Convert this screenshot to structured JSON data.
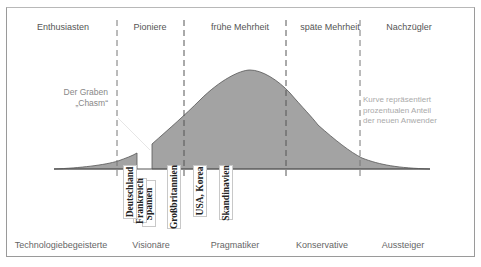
{
  "diagram": {
    "type": "technology-adoption-lifecycle",
    "header_segments": [
      {
        "label": "Enthusiasten"
      },
      {
        "label": "Pioniere"
      },
      {
        "label": "frühe Mehrheit"
      },
      {
        "label": "späte Mehrheit"
      },
      {
        "label": "Nachzügler"
      }
    ],
    "footer_segments": [
      {
        "label": "Technologiebegeisterte"
      },
      {
        "label": "Visionäre"
      },
      {
        "label": "Pragmatiker"
      },
      {
        "label": "Konservative"
      },
      {
        "label": "Aussteiger"
      }
    ],
    "chasm_label": {
      "line1": "Der Graben",
      "line2": "„Chasm“"
    },
    "curve_note": {
      "line1": "Kurve repräsentiert",
      "line2": "prozentualen Anteil",
      "line3": "der neuen Anwender"
    },
    "countries": [
      {
        "label": "Deutschland"
      },
      {
        "label": "Frankreich"
      },
      {
        "label": "Spanien"
      },
      {
        "label": "Großbritannien"
      },
      {
        "label": "USA, Korea"
      },
      {
        "label": "Skandinavien"
      }
    ],
    "colors": {
      "curve_fill": "#a3a3a3",
      "curve_stroke": "#555555",
      "divider": "#555555",
      "frame": "#9a9a9a"
    }
  }
}
